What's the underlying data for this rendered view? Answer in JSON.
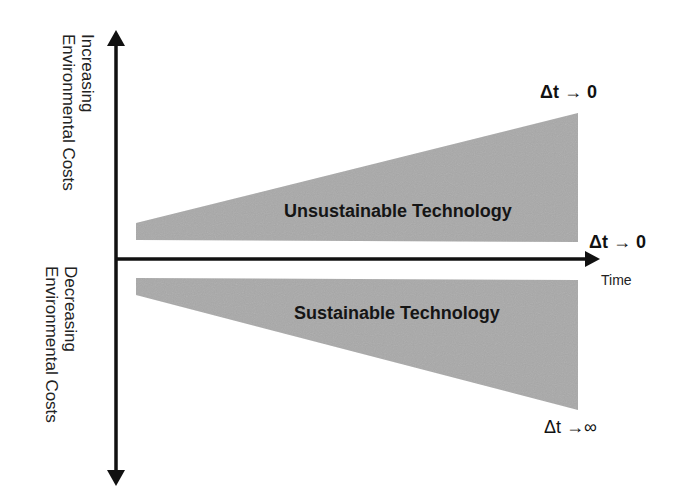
{
  "diagram": {
    "y_axis": {
      "positive_label": {
        "line1": "Increasing",
        "line2": "Environmental Costs"
      },
      "negative_label": {
        "line1": "Decreasing",
        "line2": "Environmental Costs"
      }
    },
    "x_axis": {
      "label": "Time"
    },
    "regions": [
      {
        "name": "Unsustainable Technology",
        "end_label": "Δt → 0",
        "start_label": "Δt → 0"
      },
      {
        "name": "Sustainable Technology",
        "end_label": "Δt →∞"
      }
    ],
    "colors": {
      "fill": "#a9a9a9",
      "axis": "#111111",
      "background": "#ffffff"
    }
  }
}
